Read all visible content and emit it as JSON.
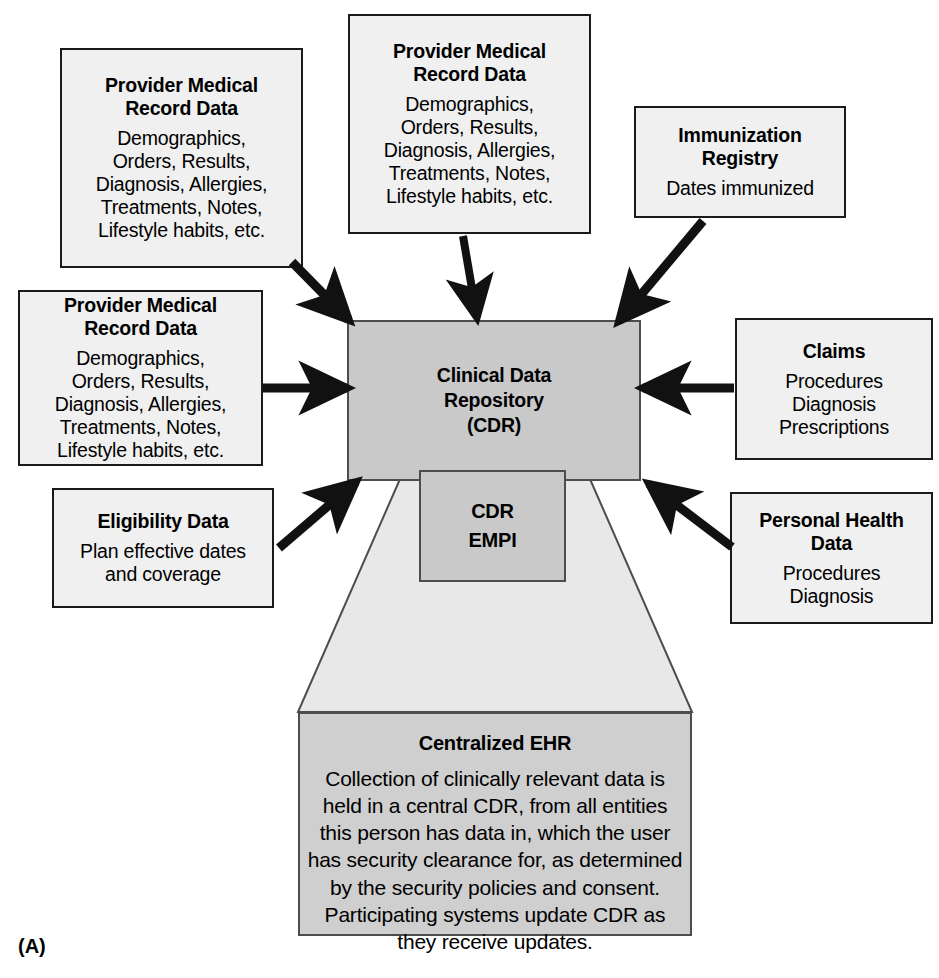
{
  "figure": {
    "label": "(A)",
    "caption_letter": "(A)"
  },
  "colors": {
    "box_fill": "#f0f0f0",
    "box_border": "#1a1a1a",
    "cdr_fill": "#c9c9c9",
    "ehr_fill": "#cfcfcf",
    "funnel_fill": "#e6e6e6",
    "arrow": "#111111",
    "background": "#ffffff"
  },
  "nodes": {
    "provider_top_left": {
      "title": "Provider Medical\nRecord Data",
      "title_line1": "Provider Medical",
      "title_line2": "Record Data",
      "body": "Demographics,\nOrders, Results,\nDiagnosis, Allergies,\nTreatments, Notes,\nLifestyle habits, etc.",
      "body_lines": [
        "Demographics,",
        "Orders, Results,",
        "Diagnosis, Allergies,",
        "Treatments, Notes,",
        "Lifestyle habits, etc."
      ]
    },
    "provider_top_center": {
      "title_line1": "Provider Medical",
      "title_line2": "Record Data",
      "body_lines": [
        "Demographics,",
        "Orders, Results,",
        "Diagnosis, Allergies,",
        "Treatments, Notes,",
        "Lifestyle habits, etc."
      ]
    },
    "provider_left": {
      "title_line1": "Provider Medical",
      "title_line2": "Record Data",
      "body_lines": [
        "Demographics,",
        "Orders, Results,",
        "Diagnosis, Allergies,",
        "Treatments, Notes,",
        "Lifestyle habits, etc."
      ]
    },
    "immunization_registry": {
      "title_line1": "Immunization",
      "title_line2": "Registry",
      "body_lines": [
        "Dates immunized"
      ]
    },
    "claims": {
      "title_line1": "Claims",
      "body_lines": [
        "Procedures",
        "Diagnosis",
        "Prescriptions"
      ]
    },
    "personal_health_data": {
      "title_line1": "Personal Health",
      "title_line2": "Data",
      "body_lines": [
        "Procedures",
        "Diagnosis"
      ]
    },
    "eligibility_data": {
      "title_line1": "Eligibility Data",
      "body_lines": [
        "Plan effective dates",
        "and coverage"
      ]
    },
    "cdr": {
      "title_line1": "Clinical Data",
      "title_line2": "Repository",
      "title_line3": "(CDR)"
    },
    "cdr_empi": {
      "title_line1": "CDR",
      "title_line2": "EMPI"
    },
    "centralized_ehr": {
      "title_line1": "Centralized EHR",
      "body_lines": [
        "Collection of clinically relevant data is",
        "held in a central CDR, from all entities",
        "this person has data in, which the user",
        "has security clearance for, as determined",
        "by the security policies and consent.",
        "Participating systems update CDR as",
        "they receive updates."
      ]
    }
  },
  "connections": [
    {
      "name": "provider-top-left-to-cdr",
      "from": "provider_top_left",
      "to": "cdr",
      "direction": "into-cdr"
    },
    {
      "name": "provider-top-center-to-cdr",
      "from": "provider_top_center",
      "to": "cdr",
      "direction": "into-cdr"
    },
    {
      "name": "immunization-registry-to-cdr",
      "from": "immunization_registry",
      "to": "cdr",
      "direction": "into-cdr"
    },
    {
      "name": "provider-left-to-cdr",
      "from": "provider_left",
      "to": "cdr",
      "direction": "into-cdr"
    },
    {
      "name": "claims-to-cdr",
      "from": "claims",
      "to": "cdr",
      "direction": "into-cdr"
    },
    {
      "name": "eligibility-data-to-cdr",
      "from": "eligibility_data",
      "to": "cdr",
      "direction": "into-cdr"
    },
    {
      "name": "personal-health-data-to-cdr",
      "from": "personal_health_data",
      "to": "cdr",
      "direction": "into-cdr"
    },
    {
      "name": "cdr-to-centralized-ehr",
      "from": "cdr",
      "to": "centralized_ehr",
      "direction": "funnel"
    }
  ]
}
